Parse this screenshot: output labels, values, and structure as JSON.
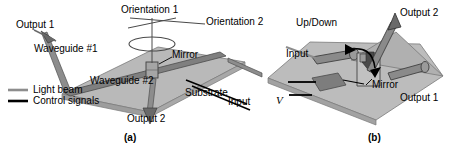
{
  "figure": {
    "caption_a": "(a)",
    "caption_b": "(b)",
    "panel_a": {
      "labels": {
        "output1": "Output 1",
        "output2": "Output 2",
        "waveguide1": "Waveguide #1",
        "waveguide2": "Waveguide #2",
        "substrate": "Substrate",
        "mirror": "Mirror",
        "orientation1": "Orientation 1",
        "orientation2": "Orientation 2",
        "input": "Input"
      }
    },
    "panel_b": {
      "labels": {
        "updown": "Up/Down",
        "input": "Input",
        "output1": "Output 1",
        "output2": "Output 2",
        "mirror": "Mirror",
        "voltage": "V"
      }
    },
    "legend": {
      "items": [
        {
          "label": "Light beam",
          "color": "#8d8d8d",
          "icon": "gray-line-icon"
        },
        {
          "label": "Control signals",
          "color": "#000000",
          "icon": "black-line-icon"
        }
      ]
    },
    "colors": {
      "substrate_fill": "#b8b8b8",
      "substrate_stroke": "#6e6e6e",
      "waveguide_fill": "#8a8a8a",
      "waveguide_stroke": "#4a4a4a",
      "mirror_fill": "#9a9a9a",
      "beam_gray": "#8d8d8d",
      "control_black": "#000000",
      "electrode_fill": "#7d7d7d",
      "background": "#ffffff"
    }
  }
}
